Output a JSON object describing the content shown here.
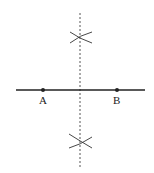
{
  "diagram": {
    "segment": {
      "x1": 16,
      "y1": 90,
      "x2": 145,
      "y2": 90,
      "color": "#222222"
    },
    "points": [
      {
        "label": "A",
        "x": 43,
        "y": 90,
        "label_x": 40,
        "label_y": 104
      },
      {
        "label": "B",
        "x": 117,
        "y": 90,
        "label_x": 114,
        "label_y": 104
      }
    ],
    "bisector": {
      "x": 80,
      "y_start": 13,
      "y_end": 167,
      "style": "dashed",
      "color": "#555555"
    },
    "arc_intersections": [
      {
        "x": 80,
        "y": 37
      },
      {
        "x": 80,
        "y": 143
      }
    ]
  }
}
